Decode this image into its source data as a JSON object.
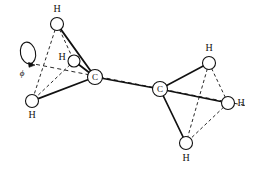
{
  "figure": {
    "kind": "molecular-structure-diagram",
    "molecule": "ethane",
    "stroke_color": "#111111",
    "atom_fill_color": "#ffffff",
    "background_color": "#ffffff"
  },
  "atoms": [
    {
      "id": "C1",
      "element": "C",
      "label": "C",
      "x": 95,
      "y": 77,
      "r": 7.5,
      "label_dx": 0,
      "label_dy": 0
    },
    {
      "id": "C2",
      "element": "C",
      "label": "C",
      "x": 160,
      "y": 89,
      "r": 7.5,
      "label_dx": 0,
      "label_dy": 0
    },
    {
      "id": "H1",
      "element": "H",
      "label": "H",
      "x": 57,
      "y": 24,
      "r": 6.5,
      "label_dx": 0,
      "label_dy": -15
    },
    {
      "id": "H2",
      "element": "H",
      "label": "H",
      "x": 74,
      "y": 61,
      "r": 6.0,
      "label_dx": -12,
      "label_dy": -4
    },
    {
      "id": "H3",
      "element": "H",
      "label": "H",
      "x": 32,
      "y": 101,
      "r": 6.5,
      "label_dx": 0,
      "label_dy": 14
    },
    {
      "id": "H4",
      "element": "H",
      "label": "H",
      "x": 209,
      "y": 63,
      "r": 6.5,
      "label_dx": 0,
      "label_dy": -15
    },
    {
      "id": "H5",
      "element": "H",
      "label": "H",
      "x": 228,
      "y": 103,
      "r": 6.5,
      "label_dx": 13,
      "label_dy": 0
    },
    {
      "id": "H6",
      "element": "H",
      "label": "H",
      "x": 186,
      "y": 143,
      "r": 6.5,
      "label_dx": 0,
      "label_dy": 15
    }
  ],
  "bonds": [
    {
      "from": "C1",
      "to": "C2",
      "style": "solid",
      "width": 1.6,
      "name": "carbon-carbon-bond"
    },
    {
      "from": "C1",
      "to": "H1",
      "style": "solid",
      "width": 1.8,
      "name": "bond-c1-h1"
    },
    {
      "from": "C1",
      "to": "H2",
      "style": "solid",
      "width": 1.8,
      "name": "bond-c1-h2"
    },
    {
      "from": "C1",
      "to": "H3",
      "style": "solid",
      "width": 1.8,
      "name": "bond-c1-h3"
    },
    {
      "from": "C2",
      "to": "H4",
      "style": "solid",
      "width": 1.6,
      "name": "bond-c2-h4"
    },
    {
      "from": "C2",
      "to": "H5",
      "style": "solid",
      "width": 1.6,
      "name": "bond-c2-h5"
    },
    {
      "from": "C2",
      "to": "H6",
      "style": "solid",
      "width": 1.6,
      "name": "bond-c2-h6"
    }
  ],
  "tetrahedron_edges": [
    {
      "from": "H1",
      "to": "H2",
      "style": "dashed",
      "name": "edge-h1-h2"
    },
    {
      "from": "H1",
      "to": "H3",
      "style": "dashed",
      "name": "edge-h1-h3"
    },
    {
      "from": "H2",
      "to": "H3",
      "style": "dashed",
      "name": "edge-h2-h3"
    },
    {
      "from": "H4",
      "to": "H5",
      "style": "dashed",
      "name": "edge-h4-h5"
    },
    {
      "from": "H4",
      "to": "H6",
      "style": "dashed",
      "name": "edge-h4-h6"
    },
    {
      "from": "H5",
      "to": "H6",
      "style": "dashed",
      "name": "edge-h5-h6"
    }
  ],
  "rotation_axis": {
    "name": "rotation-axis",
    "style": "dashed",
    "x1": 29,
    "y1": 63,
    "x2": 248,
    "y2": 106
  },
  "rotation_marker": {
    "name": "rotation-arrow",
    "ellipse": {
      "cx": 28,
      "cy": 53,
      "rx": 7.5,
      "ry": 11,
      "rotate": -12
    },
    "label": "ϕ",
    "label_x": 22,
    "label_y": 73
  }
}
